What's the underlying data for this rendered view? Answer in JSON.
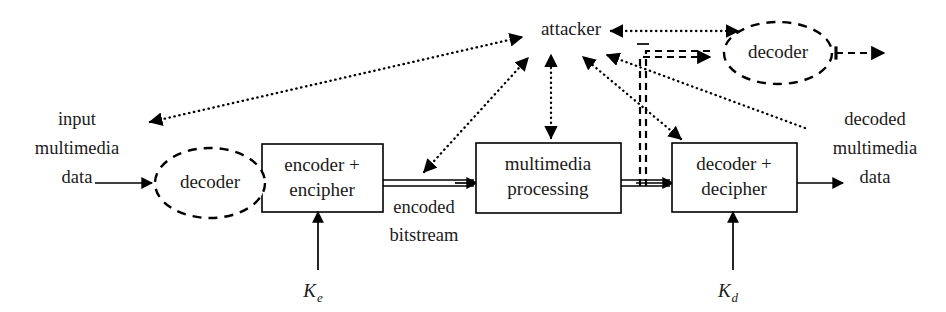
{
  "diagram": {
    "background_color": "#ffffff",
    "stroke_color": "#000000",
    "nodes": {
      "input_decoder": {
        "label": "decoder",
        "shape": "dashed-ellipse",
        "cx": 210,
        "cy": 183,
        "rx": 55,
        "ry": 35
      },
      "encoder": {
        "label_line1": "encoder +",
        "label_line2": "encipher",
        "shape": "rect",
        "x": 262,
        "y": 144,
        "w": 121,
        "h": 68
      },
      "processing": {
        "label_line1": "multimedia",
        "label_line2": "processing",
        "shape": "rect",
        "x": 476,
        "y": 143,
        "w": 145,
        "h": 70
      },
      "decipher": {
        "label_line1": "decoder +",
        "label_line2": "decipher",
        "shape": "rect",
        "x": 672,
        "y": 143,
        "w": 125,
        "h": 69
      },
      "attacker": {
        "label": "attacker",
        "shape": "text",
        "cx": 571,
        "cy": 30
      },
      "output_decoder": {
        "label": "decoder",
        "shape": "dashed-ellipse",
        "cx": 778,
        "cy": 53,
        "rx": 54,
        "ry": 31
      }
    },
    "labels": {
      "input_data": {
        "line1": "input",
        "line2": "multimedia",
        "line3": "data",
        "cx": 77,
        "cy": 125
      },
      "encoded_bitstream": {
        "line1": "encoded",
        "line2": "bitstream",
        "cx": 424,
        "cy": 222
      },
      "decoded_data": {
        "line1": "decoded",
        "line2": "multimedia",
        "line3": "data",
        "cx": 875,
        "cy": 125
      },
      "key_encrypt": {
        "symbol": "K",
        "subscript": "e",
        "cx": 318,
        "cy": 292
      },
      "key_decrypt": {
        "symbol": "K",
        "subscript": "d",
        "cx": 733,
        "cy": 292
      }
    },
    "edges": [
      {
        "name": "input-to-decoder",
        "style": "solid",
        "from": "input data",
        "to": "input decoder"
      },
      {
        "name": "decoder-to-encoder",
        "style": "solid",
        "from": "input decoder",
        "to": "encoder"
      },
      {
        "name": "encoder-to-processing",
        "style": "double",
        "from": "encoder",
        "to": "multimedia processing"
      },
      {
        "name": "processing-to-decipher",
        "style": "double",
        "from": "multimedia processing",
        "to": "decoder + decipher"
      },
      {
        "name": "decipher-to-output",
        "style": "solid",
        "from": "decoder + decipher",
        "to": "decoded multimedia data"
      },
      {
        "name": "key-encrypt-to-encoder",
        "style": "solid",
        "from": "Ke",
        "to": "encoder"
      },
      {
        "name": "key-decrypt-to-decipher",
        "style": "solid",
        "from": "Kd",
        "to": "decoder + decipher"
      },
      {
        "name": "attacker-to-input-data",
        "style": "dotted-bidirectional",
        "from": "attacker",
        "to": "input multimedia data"
      },
      {
        "name": "attacker-to-bitstream",
        "style": "dotted-bidirectional",
        "from": "attacker",
        "to": "encoded bitstream"
      },
      {
        "name": "attacker-to-processing",
        "style": "dotted-bidirectional",
        "from": "attacker",
        "to": "multimedia processing"
      },
      {
        "name": "attacker-to-decipher",
        "style": "dotted-bidirectional",
        "from": "attacker",
        "to": "decoder + decipher"
      },
      {
        "name": "decoded-data-to-attacker",
        "style": "dotted",
        "from": "decoded multimedia data",
        "to": "attacker"
      },
      {
        "name": "attacker-to-output-decoder",
        "style": "dotted-bidirectional",
        "from": "attacker",
        "to": "output decoder"
      },
      {
        "name": "bitstream-to-output-decoder",
        "style": "dashed-double",
        "from": "encoded bitstream",
        "to": "output decoder"
      },
      {
        "name": "output-decoder-out",
        "style": "dashed",
        "from": "output decoder",
        "to": "open"
      }
    ]
  }
}
